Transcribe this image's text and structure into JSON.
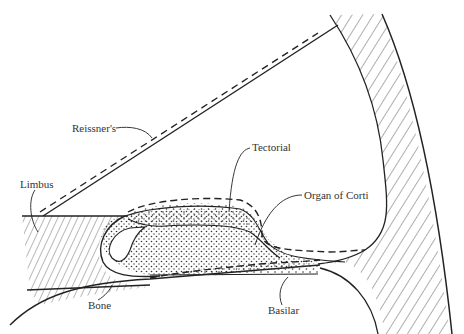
{
  "diagram": {
    "labels": {
      "reissner": "Reissner's",
      "tectorial": "Tectorial",
      "limbus": "Limbus",
      "organ_of_corti": "Organ of Corti",
      "bone": "Bone",
      "basilar": "Basilar"
    },
    "legend_style": {
      "solid_line": "resting position",
      "dashed_line": "displaced position"
    },
    "colors": {
      "ink": "#222222",
      "background": "#ffffff"
    }
  }
}
